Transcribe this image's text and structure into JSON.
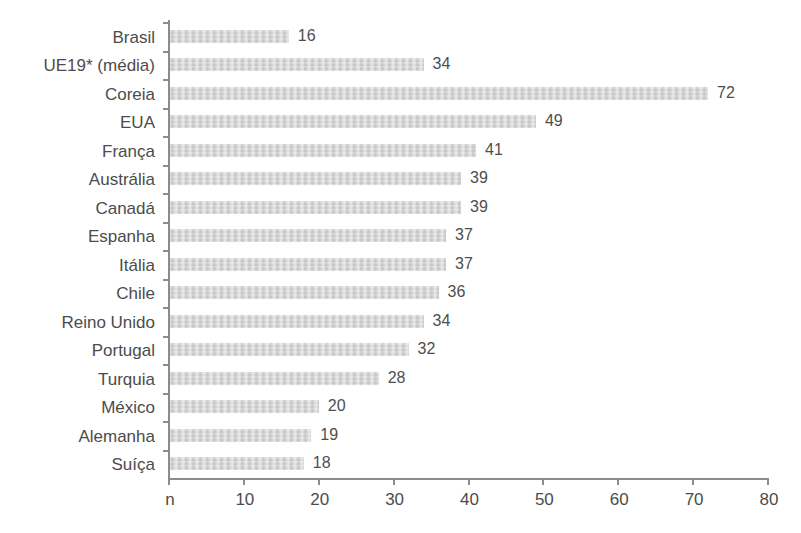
{
  "chart_data": {
    "type": "bar",
    "orientation": "horizontal",
    "title": "",
    "subtitle": "",
    "xlabel": "",
    "ylabel": "",
    "xlim": [
      0,
      80
    ],
    "xticks": [
      0,
      10,
      20,
      30,
      40,
      50,
      60,
      70,
      80
    ],
    "xtick_labels": [
      "n",
      "10",
      "20",
      "30",
      "40",
      "50",
      "60",
      "70",
      "80"
    ],
    "grid": false,
    "legend": null,
    "legend_position": "none",
    "bar_color": "#d6d6d6",
    "axis_color": "#8c8c8c",
    "text_color": "#4c4c4c",
    "value_labels_shown": true,
    "categories": [
      "Brasil",
      "UE19* (média)",
      "Coreia",
      "EUA",
      "França",
      "Austrália",
      "Canadá",
      "Espanha",
      "Itália",
      "Chile",
      "Reino Unido",
      "Portugal",
      "Turquia",
      "México",
      "Alemanha",
      "Suíça"
    ],
    "values": [
      16,
      34,
      72,
      49,
      41,
      39,
      39,
      37,
      37,
      36,
      34,
      32,
      28,
      20,
      19,
      18
    ],
    "value_labels": [
      "16",
      "34",
      "72",
      "49",
      "41",
      "39",
      "39",
      "37",
      "37",
      "36",
      "34",
      "32",
      "28",
      "20",
      "19",
      "18"
    ]
  }
}
